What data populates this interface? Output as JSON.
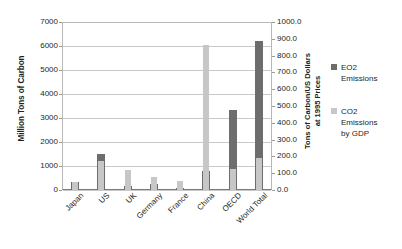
{
  "chart_data": {
    "type": "bar",
    "title": "",
    "subtitle": "",
    "xlabel": "",
    "ylabel": "Million Tons of Carbon",
    "y2label": "Tons of Carbon/US Dollars at 1995 Prices",
    "grid": true,
    "legend_position": "right",
    "categories": [
      "Japan",
      "US",
      "UK",
      "Germany",
      "France",
      "China",
      "OECD",
      "World Total"
    ],
    "ylim": [
      0,
      7000
    ],
    "y2lim": [
      0,
      1000
    ],
    "yticks": [
      "0",
      "1000",
      "2000",
      "3000",
      "4000",
      "5000",
      "6000",
      "7000"
    ],
    "y2ticks": [
      "0.0",
      "100.0",
      "200.0",
      "300.0",
      "400.0",
      "500.0",
      "600.0",
      "700.0",
      "800.0",
      "900.0",
      "1000.0"
    ],
    "series": [
      {
        "name": "EO2 Emissions",
        "axis": "left",
        "color": "#6d6d6d",
        "values": [
          320,
          1520,
          150,
          230,
          100,
          800,
          3350,
          6200
        ]
      },
      {
        "name": "CO2 Emissions by GDP",
        "axis": "right",
        "color": "#c7c7c7",
        "values": [
          50,
          175,
          118,
          80,
          55,
          865,
          123,
          190
        ]
      }
    ]
  },
  "axes": {
    "left": {
      "title": "Million Tons of Carbon",
      "ticks": [
        "7000",
        "6000",
        "5000",
        "4000",
        "3000",
        "2000",
        "1000",
        "0"
      ]
    },
    "right": {
      "title": "Tons of Carbon/US Dollars at 1995 Prices",
      "title_line1": "Tons of Carbon/US Dollars",
      "title_line2": "at 1995 Prices",
      "ticks": [
        "1000.0",
        "900.0",
        "800.0",
        "700.0",
        "600.0",
        "500.0",
        "400.0",
        "300.0",
        "200.0",
        "100.0",
        "0.0"
      ]
    },
    "categories": [
      "Japan",
      "US",
      "UK",
      "Germany",
      "France",
      "China",
      "OECD",
      "World Total"
    ]
  },
  "legend": {
    "items": [
      {
        "label": "EO2\nEmissions",
        "color": "#6d6d6d"
      },
      {
        "label": "CO2\nEmissions\nby GDP",
        "color": "#c7c7c7"
      }
    ]
  }
}
